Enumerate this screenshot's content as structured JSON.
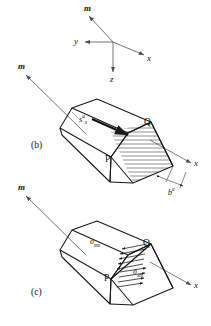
{
  "figure": {
    "background_color": "#ffffff",
    "line_color": "#1a1a1a",
    "axis_color": "#555555",
    "hatch_color": "#333333",
    "width": 211,
    "height": 326
  },
  "axes_inset": {
    "name": "coordinate-axes",
    "arrows": [
      {
        "label": "m",
        "direction": "up-left",
        "style": "italic-bold"
      },
      {
        "label": "y",
        "direction": "left",
        "style": "italic"
      },
      {
        "label": "x",
        "direction": "down-right",
        "style": "italic"
      },
      {
        "label": "z",
        "direction": "down",
        "style": "italic"
      }
    ]
  },
  "panel_b": {
    "caption": "(b)",
    "normal_arrow_label": "m",
    "axis_label": "x",
    "slip_vector": {
      "base": "s",
      "superscript": "a",
      "subscript": "x"
    },
    "thickness": {
      "base": "b",
      "superscript": "a"
    },
    "points": [
      {
        "label": "P"
      },
      {
        "label": "Q"
      }
    ],
    "hatched_face": "slip-plane",
    "burgers_arrow": "displacement-arrow"
  },
  "panel_c": {
    "caption": "(c)",
    "normal_arrow_label": "m",
    "axis_label": "x",
    "stress_upper": {
      "base": "σ",
      "subscript": "mx"
    },
    "stress_lower": {
      "base": "σ",
      "subscript": "xm"
    },
    "points": [
      {
        "label": "P"
      },
      {
        "label": "Q"
      }
    ]
  }
}
